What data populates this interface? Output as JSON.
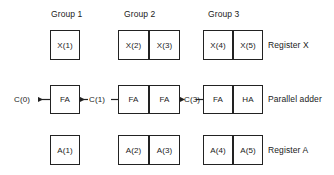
{
  "diagram": {
    "stroke_color": "#222222",
    "background_color": "#ffffff",
    "text_color": "#1a1a1a",
    "groups": [
      {
        "id": "group-1",
        "label": "Group 1"
      },
      {
        "id": "group-2",
        "label": "Group 2"
      },
      {
        "id": "group-3",
        "label": "Group 3"
      }
    ],
    "rows": [
      {
        "id": "register-x",
        "label": "Register X",
        "cells": [
          "X(1)",
          "X(2)",
          "X(3)",
          "X(4)",
          "X(5)"
        ]
      },
      {
        "id": "parallel-adder",
        "label": "Parallel adder",
        "cells": [
          "FA",
          "FA",
          "FA",
          "FA",
          "HA"
        ]
      },
      {
        "id": "register-a",
        "label": "Register A",
        "cells": [
          "A(1)",
          "A(2)",
          "A(3)",
          "A(4)",
          "A(5)"
        ]
      }
    ],
    "carries": [
      {
        "id": "carry-out-0",
        "label": "C(0)"
      },
      {
        "id": "carry-1",
        "label": "C(1)"
      },
      {
        "id": "carry-3",
        "label": "C(3)"
      }
    ]
  }
}
